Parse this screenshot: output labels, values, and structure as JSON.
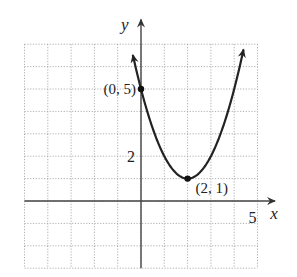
{
  "chart_data": {
    "type": "line",
    "title": "",
    "xlabel": "x",
    "ylabel": "y",
    "xlim": [
      -5,
      5.6
    ],
    "ylim": [
      -3,
      7.5
    ],
    "grid": true,
    "tick_labels": {
      "x": [
        "5"
      ],
      "y": [
        "2"
      ]
    },
    "function": "y = (x - 2)^2 + 1",
    "series": [
      {
        "name": "parabola",
        "x": [
          -0.35,
          0,
          0.5,
          1,
          1.5,
          2,
          2.5,
          3,
          3.5,
          4,
          4.4
        ],
        "values": [
          6.52,
          5,
          3.25,
          2,
          1.25,
          1,
          1.25,
          2,
          3.25,
          5,
          6.76
        ]
      }
    ],
    "points": [
      {
        "x": 0,
        "y": 5,
        "label": "(0, 5)"
      },
      {
        "x": 2,
        "y": 1,
        "label": "(2, 1)"
      }
    ],
    "colors": {
      "curve": "#222222",
      "axes": "#444444",
      "grid": "#9a9a9a"
    }
  }
}
